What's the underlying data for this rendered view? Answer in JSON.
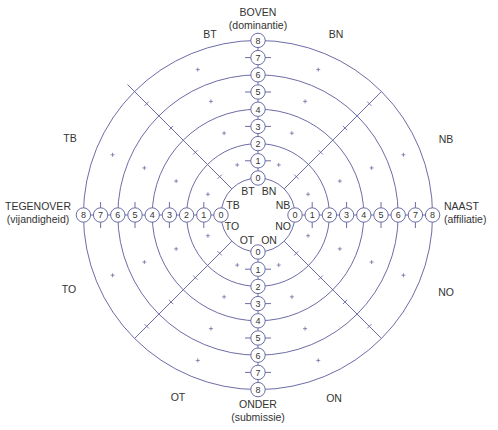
{
  "diagram": {
    "center": {
      "x": 258,
      "y": 215
    },
    "ring_step": 17.2,
    "inner_radius": 37,
    "line_color": "#5b5b9b",
    "text_color": "#333333",
    "rings": [
      0,
      1,
      2,
      3,
      4,
      5,
      6,
      7,
      8
    ],
    "drawn_circles": [
      0,
      2,
      4,
      6,
      8
    ]
  },
  "axes": {
    "top": {
      "label": "BOVEN",
      "sublabel": "(dominantie)"
    },
    "bottom": {
      "label": "ONDER",
      "sublabel": "(submissie)"
    },
    "left": {
      "label": "TEGENOVER",
      "sublabel": "(vijandigheid)"
    },
    "right": {
      "label": "NAAST",
      "sublabel": "(affiliatie)"
    }
  },
  "octants_outer": [
    {
      "id": "BT",
      "label": "BT",
      "x": 210,
      "y": 34
    },
    {
      "id": "BN",
      "label": "BN",
      "x": 336,
      "y": 34
    },
    {
      "id": "NB",
      "label": "NB",
      "x": 446,
      "y": 139
    },
    {
      "id": "NO",
      "label": "NO",
      "x": 446,
      "y": 292
    },
    {
      "id": "ON",
      "label": "ON",
      "x": 334,
      "y": 398
    },
    {
      "id": "OT",
      "label": "OT",
      "x": 178,
      "y": 397
    },
    {
      "id": "TO",
      "label": "TO",
      "x": 69,
      "y": 289
    },
    {
      "id": "TB",
      "label": "TB",
      "x": 70,
      "y": 138
    }
  ],
  "octants_inner": [
    {
      "id": "BT",
      "label": "BT",
      "x": 248,
      "y": 191
    },
    {
      "id": "BN",
      "label": "BN",
      "x": 269,
      "y": 191
    },
    {
      "id": "NB",
      "label": "NB",
      "x": 283,
      "y": 205
    },
    {
      "id": "NO",
      "label": "NO",
      "x": 283,
      "y": 226
    },
    {
      "id": "ON",
      "label": "ON",
      "x": 269,
      "y": 240
    },
    {
      "id": "OT",
      "label": "OT",
      "x": 247,
      "y": 240
    },
    {
      "id": "TO",
      "label": "TO",
      "x": 232,
      "y": 226
    },
    {
      "id": "TB",
      "label": "TB",
      "x": 233,
      "y": 205
    }
  ]
}
